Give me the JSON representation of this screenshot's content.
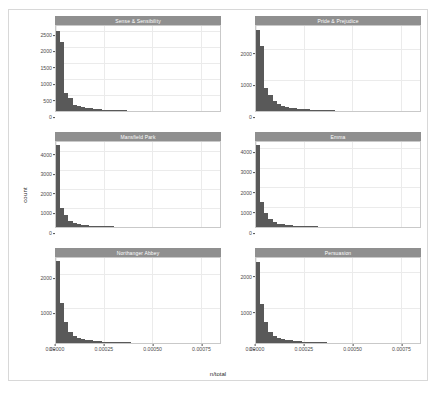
{
  "figure": {
    "type": "faceted-histogram",
    "background": "#ffffff",
    "border_color": "#d8d8d8",
    "strip_fill": "#8f8f8f",
    "strip_text_color": "#ffffff",
    "bar_fill": "#595959",
    "panel_fill": "#ffffff",
    "grid_color": "#ebebeb",
    "axis_text_color": "#4d4d4d"
  },
  "chart_data": {
    "type": "bar",
    "chart_kind": "histogram",
    "title": "",
    "xlabel": "n/total",
    "ylabel": "count",
    "grid": true,
    "legend": "none",
    "facet_layout": {
      "rows": 3,
      "cols": 2,
      "scales": "free_y"
    },
    "xlim": [
      0,
      0.00085
    ],
    "xticks": [
      0,
      0.00025,
      0.0005,
      0.00075
    ],
    "xticklabels": [
      "0.00000",
      "0.00025",
      "0.00050",
      "0.00075"
    ],
    "bin_width": 2.15e-05,
    "panels": [
      {
        "label": "Sense & Sensibility",
        "ylim": [
          0,
          2650
        ],
        "yticks": [
          0,
          500,
          1000,
          1500,
          2000,
          2500
        ],
        "yticklabels": [
          "0",
          "500",
          "1000",
          "1500",
          "2000",
          "2500"
        ],
        "values": [
          2480,
          2150,
          560,
          420,
          190,
          150,
          120,
          95,
          80,
          62,
          55,
          44,
          38,
          30,
          26,
          22,
          18,
          15,
          13,
          11,
          9,
          8,
          7,
          6,
          5,
          5,
          4,
          4,
          3,
          3,
          2,
          2,
          2,
          2,
          1,
          1,
          1,
          1,
          1,
          1
        ]
      },
      {
        "label": "Pride & Prejudice",
        "ylim": [
          0,
          2750
        ],
        "yticks": [
          0,
          1000,
          2000
        ],
        "yticklabels": [
          "0",
          "1000",
          "2000"
        ],
        "values": [
          2620,
          2100,
          760,
          520,
          330,
          230,
          175,
          140,
          110,
          88,
          72,
          60,
          50,
          42,
          35,
          29,
          24,
          20,
          17,
          14,
          12,
          10,
          9,
          8,
          7,
          6,
          5,
          4,
          4,
          3,
          3,
          2,
          2,
          2,
          1,
          1,
          1,
          1,
          1,
          1
        ]
      },
      {
        "label": "Mansfield Park",
        "ylim": [
          0,
          4450
        ],
        "yticks": [
          0,
          1000,
          2000,
          3000,
          4000
        ],
        "yticklabels": [
          "0",
          "1000",
          "2000",
          "3000",
          "4000"
        ],
        "values": [
          4300,
          1000,
          610,
          330,
          210,
          150,
          115,
          92,
          74,
          60,
          50,
          42,
          35,
          29,
          25,
          21,
          18,
          15,
          13,
          11,
          9,
          8,
          7,
          6,
          5,
          4,
          4,
          3,
          3,
          2,
          2,
          2,
          1,
          1,
          1,
          1,
          1,
          1,
          1,
          1
        ]
      },
      {
        "label": "Emma",
        "ylim": [
          0,
          4300
        ],
        "yticks": [
          0,
          1000,
          2000,
          3000,
          4000
        ],
        "yticklabels": [
          "0",
          "1000",
          "2000",
          "3000",
          "4000"
        ],
        "values": [
          4150,
          1250,
          700,
          390,
          250,
          175,
          135,
          105,
          85,
          68,
          56,
          46,
          38,
          32,
          27,
          23,
          19,
          16,
          14,
          12,
          10,
          9,
          7,
          6,
          5,
          5,
          4,
          3,
          3,
          2,
          2,
          2,
          1,
          1,
          1,
          1,
          1,
          1,
          1,
          1
        ]
      },
      {
        "label": "Northanger Abbey",
        "ylim": [
          0,
          2450
        ],
        "yticks": [
          0,
          1000,
          2000
        ],
        "yticklabels": [
          "0",
          "1000",
          "2000"
        ],
        "values": [
          2350,
          1150,
          620,
          330,
          210,
          150,
          115,
          92,
          74,
          60,
          50,
          42,
          35,
          30,
          25,
          21,
          18,
          15,
          13,
          11,
          9,
          8,
          7,
          6,
          5,
          4,
          4,
          3,
          3,
          2,
          2,
          2,
          1,
          1,
          1,
          1,
          1,
          1,
          1,
          1
        ]
      },
      {
        "label": "Persuasion",
        "ylim": [
          0,
          2400
        ],
        "yticks": [
          0,
          1000,
          2000
        ],
        "yticklabels": [
          "0",
          "1000",
          "2000"
        ],
        "values": [
          2300,
          1100,
          600,
          320,
          205,
          145,
          112,
          90,
          72,
          58,
          48,
          40,
          34,
          28,
          24,
          20,
          17,
          14,
          12,
          10,
          9,
          7,
          6,
          5,
          5,
          4,
          3,
          3,
          2,
          2,
          2,
          1,
          1,
          1,
          1,
          1,
          1,
          1,
          1,
          1
        ]
      }
    ]
  }
}
